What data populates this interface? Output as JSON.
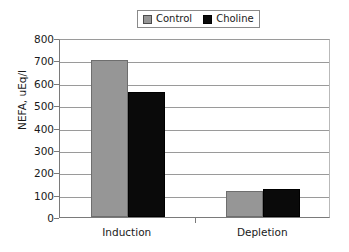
{
  "chart_data": {
    "type": "bar",
    "title": "",
    "subtitle": "",
    "xlabel": "",
    "ylabel": "NEFA, uEq/l",
    "categories": [
      "Induction",
      "Depletion"
    ],
    "series": [
      {
        "name": "Control",
        "values": [
          703,
          115
        ],
        "color": "#969696"
      },
      {
        "name": "Choline",
        "values": [
          558,
          123
        ],
        "color": "#000000"
      }
    ],
    "ylim": [
      0,
      800
    ],
    "ytick_labels": [
      "800",
      "700",
      "600",
      "500",
      "400",
      "300",
      "200",
      "100",
      "0"
    ],
    "ytick_values": [
      800,
      700,
      600,
      500,
      400,
      300,
      200,
      100,
      0
    ],
    "grid": "horizontal",
    "legend_position": "top-center"
  },
  "legend": {
    "entries": [
      {
        "label": "Control",
        "swatch": "gray-swatch-icon"
      },
      {
        "label": "Choline",
        "swatch": "black-swatch-icon"
      }
    ]
  },
  "axes": {
    "y_title": "NEFA, uEq/l",
    "y_ticks": [
      "800",
      "700",
      "600",
      "500",
      "400",
      "300",
      "200",
      "100",
      "0"
    ],
    "x_ticks": [
      "Induction",
      "Depletion"
    ]
  }
}
